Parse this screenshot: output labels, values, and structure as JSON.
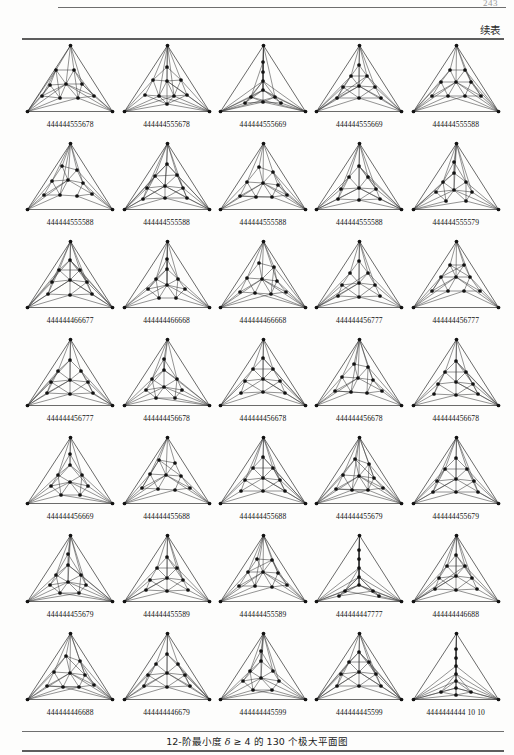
{
  "header": {
    "page_number": "243",
    "continued_label": "续表"
  },
  "footer": {
    "caption_prefix": "12-阶最小度 ",
    "caption_symbol": "δ",
    "caption_middle": " ≥ 4 的 130 个极大平面图",
    "caption_full": "12-阶最小度 δ ≥ 4 的 130 个极大平面图"
  },
  "grid": {
    "rows": 7,
    "cols": 5,
    "cells": [
      {
        "label": "444444555678",
        "layout": 0
      },
      {
        "label": "444444555678",
        "layout": 1
      },
      {
        "label": "444444555669",
        "layout": 2
      },
      {
        "label": "444444555669",
        "layout": 3
      },
      {
        "label": "444444555588",
        "layout": 4
      },
      {
        "label": "444444555588",
        "layout": 5
      },
      {
        "label": "444444555588",
        "layout": 6
      },
      {
        "label": "444444555588",
        "layout": 7
      },
      {
        "label": "444444555588",
        "layout": 8
      },
      {
        "label": "444444555579",
        "layout": 9
      },
      {
        "label": "444444466677",
        "layout": 10
      },
      {
        "label": "444444466668",
        "layout": 11
      },
      {
        "label": "444444466668",
        "layout": 12
      },
      {
        "label": "444444456777",
        "layout": 13
      },
      {
        "label": "444444456777",
        "layout": 14
      },
      {
        "label": "444444456777",
        "layout": 15
      },
      {
        "label": "444444456678",
        "layout": 16
      },
      {
        "label": "444444456678",
        "layout": 17
      },
      {
        "label": "444444456678",
        "layout": 18
      },
      {
        "label": "444444456678",
        "layout": 19
      },
      {
        "label": "444444456669",
        "layout": 20
      },
      {
        "label": "444444455688",
        "layout": 21
      },
      {
        "label": "444444455688",
        "layout": 22
      },
      {
        "label": "444444455679",
        "layout": 23
      },
      {
        "label": "444444455679",
        "layout": 24
      },
      {
        "label": "444444455679",
        "layout": 25
      },
      {
        "label": "444444455589",
        "layout": 26
      },
      {
        "label": "444444455589",
        "layout": 27
      },
      {
        "label": "444444447777",
        "layout": 28
      },
      {
        "label": "444444446688",
        "layout": 29
      },
      {
        "label": "444444446688",
        "layout": 30
      },
      {
        "label": "444444446679",
        "layout": 31
      },
      {
        "label": "444444445599",
        "layout": 32
      },
      {
        "label": "444444445599",
        "layout": 33
      },
      {
        "label": "4444444444 10 10",
        "layout": 34
      }
    ]
  },
  "style": {
    "edge_color": "#3a3a3a",
    "node_color": "#121212",
    "rule_color": "#5d5d5d",
    "text_color": "#1a1a1a"
  }
}
